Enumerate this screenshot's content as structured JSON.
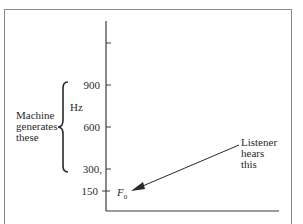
{
  "diagram": {
    "y_axis": {
      "unit_label": "Hz",
      "ticks": [
        {
          "label": "900",
          "value": 900
        },
        {
          "label": "600",
          "value": 600
        },
        {
          "label": "300,",
          "value": 300
        },
        {
          "label": "150",
          "value": 150
        }
      ]
    },
    "bracket_label": {
      "lines": [
        "Machine",
        "generates",
        "these"
      ]
    },
    "fundamental_label": {
      "symbol": "F",
      "subscript": "0"
    },
    "arrow_annotation": {
      "lines": [
        "Listener",
        "hears",
        "this"
      ]
    }
  }
}
